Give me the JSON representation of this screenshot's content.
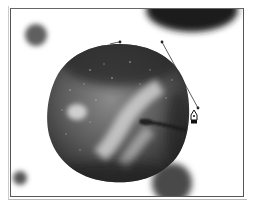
{
  "canvas": {
    "width": 256,
    "height": 206,
    "background": "#ffffff",
    "frame_color": "#555555"
  },
  "scene": {
    "subject": "apple",
    "tool": "pen-tool",
    "colors": {
      "apple_dark": "#2a2a2a",
      "apple_mid": "#6e6e6e",
      "apple_highlight": "#d8d8d8",
      "blur_blob": "#5a5a5a",
      "path_line": "#333333"
    }
  },
  "path": {
    "anchors": [
      {
        "x": 120,
        "y": 42
      },
      {
        "x": 186,
        "y": 128
      }
    ],
    "handles": [
      {
        "x": 162,
        "y": 42
      },
      {
        "x": 198,
        "y": 108
      }
    ]
  },
  "cursor": {
    "icon": "pen-tool-icon",
    "x": 194,
    "y": 117
  }
}
